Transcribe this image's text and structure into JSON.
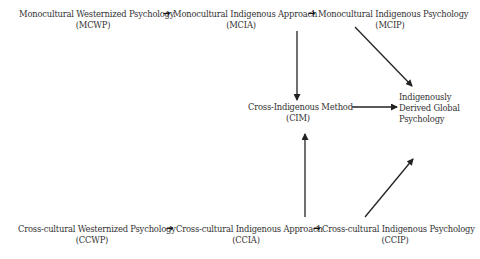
{
  "diagram": {
    "top_row": [
      {
        "id": "MCWP",
        "label": "Monocultural Westernized Psychology",
        "abbr": "(MCWP)"
      },
      {
        "id": "MCIA",
        "label": "Monocultural Indigenous Approach",
        "abbr": "(MCIA)"
      },
      {
        "id": "MCIP",
        "label": "Monocultural Indigenous Psychology",
        "abbr": "(MCIP)"
      }
    ],
    "middle": {
      "cim": {
        "id": "CIM",
        "label": "Cross-Indigenous Method",
        "abbr": "(CIM)"
      },
      "idgp": {
        "id": "IDGP",
        "lines": [
          "Indigenously",
          "Derived Global",
          "Psychology"
        ]
      }
    },
    "bottom_row": [
      {
        "id": "CCWP",
        "label": "Cross-cultural Westernized Psychology",
        "abbr": "(CCWP)"
      },
      {
        "id": "CCIA",
        "label": "Cross-cultural Indigenous Approach",
        "abbr": "(CCIA)"
      },
      {
        "id": "CCIP",
        "label": "Cross-cultural Indigenous Psychology",
        "abbr": "(CCIP)"
      }
    ],
    "inline_arrow_glyph": "➔",
    "edges": [
      {
        "from": "MCWP",
        "to": "MCIA"
      },
      {
        "from": "MCIA",
        "to": "MCIP"
      },
      {
        "from": "MCIA",
        "to": "CIM"
      },
      {
        "from": "MCIP",
        "to": "IDGP"
      },
      {
        "from": "CIM",
        "to": "IDGP"
      },
      {
        "from": "CCIA",
        "to": "CIM"
      },
      {
        "from": "CCIP",
        "to": "IDGP"
      },
      {
        "from": "CCWP",
        "to": "CCIA"
      },
      {
        "from": "CCIA",
        "to": "CCIP"
      }
    ],
    "colors": {
      "text": "#333333",
      "arrow": "#222222",
      "background": "#ffffff"
    }
  }
}
